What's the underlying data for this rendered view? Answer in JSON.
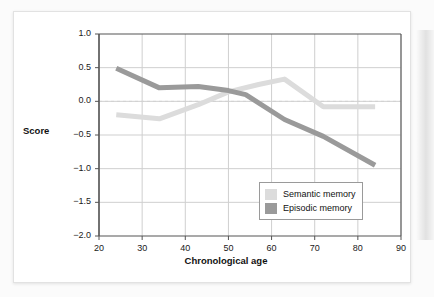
{
  "figure": {
    "y_axis_title": "Score",
    "x_axis_title": "Chronological age"
  },
  "legend": {
    "position": "inside-bottom-right",
    "entries": [
      {
        "label": "Semantic memory",
        "color": "#dcdcdc"
      },
      {
        "label": "Episodic memory",
        "color": "#9a9a9a"
      }
    ]
  },
  "colors": {
    "semantic_memory": "#dcdcdc",
    "episodic_memory": "#9a9a9a",
    "gridline": "#cfcfcf",
    "axis": "#555555",
    "zero_line": "#d2d2d2",
    "card_background": "#ffffff",
    "page_background": "#fbfbfb"
  },
  "chart_data": {
    "type": "line",
    "title": "",
    "subtitle": "",
    "xlabel": "Chronological age",
    "ylabel": "Score",
    "xlim": [
      20,
      90
    ],
    "ylim": [
      -2.0,
      1.0
    ],
    "xticks": [
      20,
      30,
      40,
      50,
      60,
      70,
      80,
      90
    ],
    "yticks": [
      1.0,
      0.5,
      0.0,
      -0.5,
      -1.0,
      -1.5,
      -2.0
    ],
    "xtick_labels": [
      "20",
      "30",
      "40",
      "50",
      "60",
      "70",
      "80",
      "90"
    ],
    "ytick_labels": [
      "1.0",
      "0.5",
      "0.0",
      "−0.5",
      "−1.0",
      "−1.5",
      "−2.0"
    ],
    "grid": true,
    "grid_axes": "both",
    "zero_reference_line": {
      "value": 0.0,
      "style": "dashed",
      "color": "#d2d2d2"
    },
    "legend": [
      "Semantic memory",
      "Episodic memory"
    ],
    "legend_position": "inside-bottom-right",
    "series": [
      {
        "name": "Semantic memory",
        "color": "#dcdcdc",
        "linewidth": 5,
        "x": [
          24,
          34,
          43,
          50,
          57,
          63,
          72,
          84
        ],
        "values": [
          -0.2,
          -0.26,
          -0.05,
          0.14,
          0.25,
          0.33,
          -0.08,
          -0.08
        ]
      },
      {
        "name": "Episodic memory",
        "color": "#9a9a9a",
        "linewidth": 5,
        "x": [
          24,
          34,
          43,
          50,
          54,
          63,
          72,
          84
        ],
        "values": [
          0.49,
          0.2,
          0.22,
          0.16,
          0.1,
          -0.27,
          -0.52,
          -0.95
        ]
      }
    ]
  }
}
